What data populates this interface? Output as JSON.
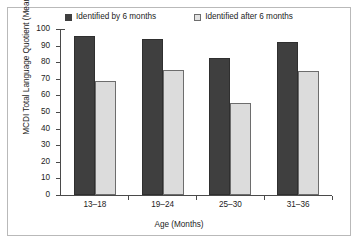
{
  "chart_data": {
    "type": "bar",
    "title": "",
    "categories": [
      "13–18",
      "19–24",
      "25–30",
      "31–36"
    ],
    "series": [
      {
        "name": "Identified by 6 months",
        "color": "#3f3f3f",
        "values": [
          96.5,
          94.5,
          83,
          93
        ]
      },
      {
        "name": "Identified after 6 months",
        "color": "#dcdcdc",
        "values": [
          69,
          76,
          56,
          75
        ]
      }
    ],
    "xlabel": "Age (Months)",
    "ylabel": "MCDI Total Language Quotient (Mean)",
    "ylim": [
      0,
      100
    ],
    "yticks": [
      0,
      10,
      20,
      30,
      40,
      50,
      60,
      70,
      80,
      90,
      100
    ],
    "ytick_labels": [
      "0",
      "10",
      "20",
      "30",
      "40",
      "50",
      "60",
      "70",
      "80",
      "90",
      "100"
    ],
    "grid": false,
    "legend_position": "top"
  }
}
